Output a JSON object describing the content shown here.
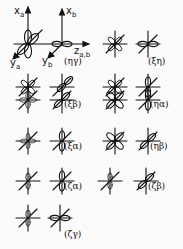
{
  "axes": {
    "xa": "x",
    "xa_sub": "a",
    "xb": "x",
    "xb_sub": "b",
    "ya": "y",
    "ya_sub": "a",
    "yb": "y",
    "yb_sub": "b",
    "zab": "z",
    "zab_sub": "a,b"
  },
  "panels": [
    {
      "label": "(ηγ)"
    },
    {
      "label": "(ξη)"
    },
    {
      "label": "(ξβ)"
    },
    {
      "label": "(ηα)"
    },
    {
      "label": "(ξα)"
    },
    {
      "label": "(ηβ)"
    },
    {
      "label": "(ζα)"
    },
    {
      "label": "(ζβ)"
    },
    {
      "label": "(ζγ)"
    }
  ]
}
